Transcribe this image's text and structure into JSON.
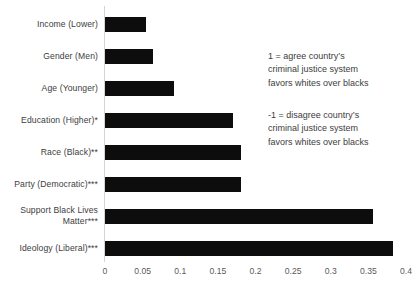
{
  "chart_data": {
    "type": "bar",
    "orientation": "horizontal",
    "title": "",
    "xlabel": "",
    "ylabel": "",
    "xlim": [
      0,
      0.4
    ],
    "grid": false,
    "legend": null,
    "xticks": [
      "0",
      "0.05",
      "0.1",
      "0.15",
      "0.2",
      "0.25",
      "0.3",
      "0.35",
      "0.4"
    ],
    "xtick_values": [
      0,
      0.05,
      0.1,
      0.15,
      0.2,
      0.25,
      0.3,
      0.35,
      0.4
    ],
    "categories": [
      "Income (Lower)",
      "Gender (Men)",
      "Age (Younger)",
      "Education (Higher)*",
      "Race (Black)**",
      "Party (Democratic)***",
      "Support Black Lives\nMatter***",
      "Ideology (Liberal)***"
    ],
    "values": [
      0.054,
      0.064,
      0.092,
      0.17,
      0.18,
      0.18,
      0.355,
      0.382
    ],
    "bar_color": "#0d0d0d",
    "annotations": [
      "1 = agree country’s\ncriminal justice system\nfavors whites over blacks",
      "-1 = disagree country’s\ncriminal justice system\nfavors whites over blacks"
    ]
  },
  "colors": {
    "background": "#ffffff",
    "bar": "#0d0d0d",
    "axis": "#d4d4d4",
    "text": "#3d3d3d",
    "tick_text": "#5a5a5a"
  }
}
